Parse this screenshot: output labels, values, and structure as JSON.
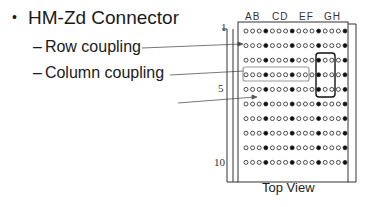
{
  "slide": {
    "bullet": {
      "symbol": "•",
      "title": "HM-Zd Connector",
      "subitems": [
        {
          "dash": "–",
          "label": "Row coupling"
        },
        {
          "dash": "–",
          "label": "Column coupling"
        }
      ]
    },
    "diagram": {
      "column_headers": [
        "AB",
        "CD",
        "EF",
        "GH"
      ],
      "row_labels": [
        {
          "row": 1,
          "label": "1"
        },
        {
          "row": 5,
          "label": "5"
        },
        {
          "row": 10,
          "label": "10"
        }
      ],
      "rows": 10,
      "pins_per_row": 16,
      "pin_pattern": "signal,signal,signal,ground",
      "caption": "Top View",
      "colors": {
        "frame": "#333333",
        "signal_pin": "#ffffff",
        "ground_pin": "#111111",
        "column_highlight": "#9a9a9a",
        "row_highlight": "#111111"
      }
    }
  }
}
